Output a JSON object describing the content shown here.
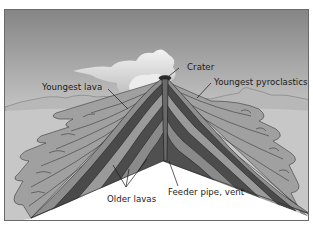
{
  "diagram": {
    "labels": {
      "crater": "Crater",
      "youngest_lava": "Youngest lava",
      "youngest_pyroclastics": "Youngest pyroclastics",
      "older_lavas": "Older lavas",
      "feeder_pipe": "Feeder pipe, vent"
    },
    "colors": {
      "sky_top": "#8a8a8a",
      "sky_bottom": "#f2f2f2",
      "cloud": "#e6e6e6",
      "distant_hills": "#b9b9b9",
      "ground": "#c4c4c4",
      "lava_flow": "#9a9a9a",
      "layer_dark": "#4a4a4a",
      "layer_mid": "#7a7a7a",
      "layer_light": "#a9a9a9",
      "outline": "#2a2a2a"
    }
  }
}
